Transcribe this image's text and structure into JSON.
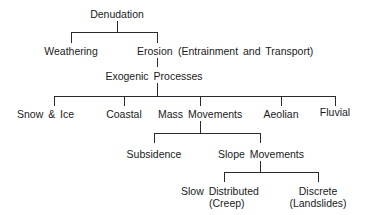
{
  "diagram": {
    "type": "tree",
    "root": {
      "label": "Denudation",
      "children": [
        {
          "label": "Weathering"
        },
        {
          "label": "Erosion",
          "note": "(Entrainment and Transport)",
          "children": [
            {
              "label": "Exogenic Processes",
              "children": [
                {
                  "label": "Snow & Ice"
                },
                {
                  "label": "Coastal"
                },
                {
                  "label": "Mass Movements",
                  "children": [
                    {
                      "label": "Subsidence"
                    },
                    {
                      "label": "Slope Movements",
                      "children": [
                        {
                          "label": "Slow Distributed",
                          "sub": "(Creep)"
                        },
                        {
                          "label": "Discrete",
                          "sub": "(Landslides)"
                        }
                      ]
                    }
                  ]
                },
                {
                  "label": "Aeolian"
                },
                {
                  "label": "Fluvial"
                }
              ]
            }
          ]
        }
      ]
    }
  },
  "nodes": {
    "denudation": "Denudation",
    "weathering": "Weathering",
    "erosion": "Erosion",
    "erosion_note": "(Entrainment and Transport)",
    "exogenic": "Exogenic Processes",
    "snow_ice": "Snow & Ice",
    "coastal": "Coastal",
    "mass_movements": "Mass Movements",
    "aeolian": "Aeolian",
    "fluvial": "Fluvial",
    "subsidence": "Subsidence",
    "slope_movements": "Slope Movements",
    "slow_distributed": "Slow Distributed",
    "creep": "(Creep)",
    "discrete": "Discrete",
    "landslides": "(Landslides)"
  },
  "colors": {
    "line": "#2a2a2a",
    "text": "#1a1a1a",
    "background": "#ffffff"
  }
}
